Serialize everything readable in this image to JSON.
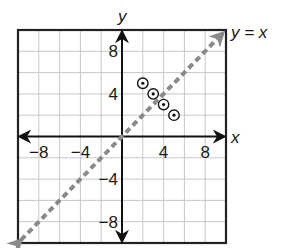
{
  "chart_data": {
    "type": "scatter",
    "title": "",
    "xlabel": "x",
    "ylabel": "y",
    "xlim": [
      -10,
      10
    ],
    "ylim": [
      -10,
      10
    ],
    "grid": true,
    "grid_step": 2,
    "x_ticks": [
      -8,
      -4,
      4,
      8
    ],
    "x_tick_labels": [
      "−8",
      "−4",
      "4",
      "8"
    ],
    "y_ticks": [
      8,
      4,
      -4,
      -8
    ],
    "y_tick_labels": [
      "8",
      "4",
      "−4",
      "−8"
    ],
    "series": [
      {
        "name": "points",
        "marker": "circled-dot",
        "points": [
          {
            "x": 2,
            "y": 5
          },
          {
            "x": 3,
            "y": 4
          },
          {
            "x": 4,
            "y": 3
          },
          {
            "x": 5,
            "y": 2
          }
        ]
      },
      {
        "name": "y = x",
        "style": "dashed-line",
        "color": "#8a8a8a",
        "from": {
          "x": -10,
          "y": -10
        },
        "to": {
          "x": 10,
          "y": 10
        }
      }
    ],
    "annotations": [
      {
        "text": "y = x",
        "at": {
          "x": 10,
          "y": 10
        }
      }
    ]
  },
  "colors": {
    "axis": "#111111",
    "grid": "#c8c8c8",
    "border": "#222222",
    "line": "#8a8a8a"
  }
}
